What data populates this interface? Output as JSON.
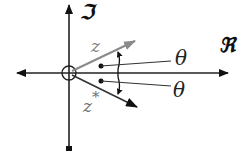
{
  "diagram": {
    "axes": {
      "real_label": "ℜ",
      "imag_label": "ℑ"
    },
    "vectors": [
      {
        "name": "z",
        "label": "z",
        "color": "#8a8a8a",
        "direction": "up-right"
      },
      {
        "name": "z-conjugate",
        "label": "z",
        "superscript": "*",
        "color": "#2a2a2a",
        "direction": "down-right"
      }
    ],
    "angles": [
      {
        "label": "θ",
        "position": "above real axis"
      },
      {
        "label": "θ",
        "position": "below real axis"
      }
    ],
    "colors": {
      "axis": "#222222",
      "z_vector": "#8a8a8a",
      "z_conj_vector": "#2a2a2a",
      "background": "#ffffff"
    }
  }
}
